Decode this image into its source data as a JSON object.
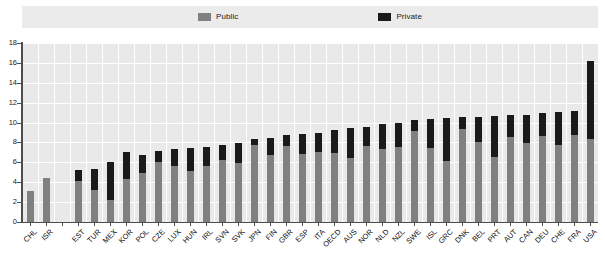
{
  "legend": {
    "position": "top",
    "items": [
      {
        "label": "Public",
        "color": "#808080",
        "icon": "square-swatch-icon"
      },
      {
        "label": "Private",
        "color": "#1a1a1a",
        "icon": "square-swatch-icon"
      }
    ]
  },
  "axis": {
    "y_ticks": [
      "0",
      "2",
      "4",
      "6",
      "8",
      "10",
      "12",
      "14",
      "16",
      "18"
    ],
    "y_min": 0,
    "y_max": 18,
    "y_step": 2
  },
  "chart_data": {
    "type": "bar",
    "title": "",
    "subtitle": "",
    "xlabel": "",
    "ylabel": "",
    "ylim": [
      0,
      18
    ],
    "ytick_step": 2,
    "grid": true,
    "stacked": true,
    "legend_position": "top",
    "categories": [
      "CHL",
      "ISR",
      "",
      "EST",
      "TUR",
      "MEX",
      "KOR",
      "POL",
      "CZE",
      "LUX",
      "HUN",
      "IRL",
      "SVN",
      "SVK",
      "JPN",
      "FIN",
      "GBR",
      "ESP",
      "ITA",
      "OECD",
      "AUS",
      "NOR",
      "NLD",
      "NZL",
      "SWE",
      "ISL",
      "GRC",
      "DNK",
      "BEL",
      "PRT",
      "AUT",
      "CAN",
      "DEU",
      "CHE",
      "FRA",
      "USA"
    ],
    "series": [
      {
        "name": "Public",
        "color": "#808080",
        "values": [
          3.1,
          4.4,
          null,
          4.1,
          3.2,
          2.2,
          4.3,
          4.9,
          6.0,
          5.6,
          5.1,
          5.6,
          6.2,
          5.9,
          7.7,
          6.7,
          7.6,
          6.8,
          7.0,
          6.9,
          6.4,
          7.6,
          7.3,
          7.5,
          9.2,
          7.4,
          6.1,
          9.4,
          8.0,
          6.5,
          8.5,
          7.9,
          8.6,
          7.7,
          8.8,
          8.3
        ]
      },
      {
        "name": "Private",
        "color": "#1a1a1a",
        "values": [
          0.0,
          0.0,
          null,
          1.1,
          2.1,
          3.8,
          2.7,
          1.8,
          1.1,
          1.7,
          2.3,
          1.9,
          1.5,
          2.0,
          0.6,
          1.7,
          1.2,
          2.1,
          2.0,
          2.4,
          3.1,
          2.0,
          2.6,
          2.5,
          1.1,
          3.0,
          4.4,
          1.2,
          2.6,
          4.2,
          2.3,
          2.9,
          2.4,
          3.4,
          2.4,
          7.9
        ]
      }
    ],
    "totals": [
      3.1,
      4.4,
      null,
      5.2,
      5.3,
      6.0,
      7.0,
      6.7,
      7.1,
      7.3,
      7.4,
      7.5,
      7.7,
      7.9,
      8.3,
      8.4,
      8.8,
      8.9,
      9.0,
      9.3,
      9.5,
      9.6,
      9.9,
      10.0,
      10.3,
      10.4,
      10.5,
      10.6,
      10.6,
      10.7,
      10.8,
      10.8,
      11.0,
      11.1,
      11.2,
      16.2
    ]
  }
}
